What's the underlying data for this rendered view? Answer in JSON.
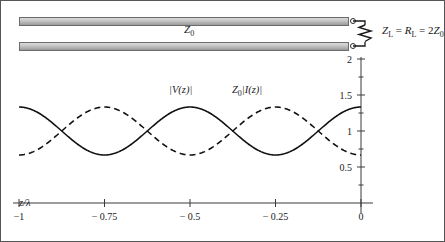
{
  "figure": {
    "schematic": {
      "line_impedance_label": "Z",
      "line_impedance_sub": "0",
      "load_label_parts": {
        "zl": "Z",
        "zl_sub": "L",
        "eq1": " = ",
        "rl": "R",
        "rl_sub": "L",
        "eq2": " = 2",
        "z0": "Z",
        "z0_sub": "0"
      },
      "load_label_plain": "ZL = RL = 2Z0",
      "terminal_icon": "open-terminal-dot",
      "resistor_icon": "zigzag-resistor-icon"
    },
    "plot": {
      "x_axis_label": "z/λ",
      "curve_label_voltage": {
        "text": "|V(z)|"
      },
      "curve_label_current": {
        "prefix": "Z",
        "sub": "0",
        "text": "|I(z)|"
      },
      "curve_label_current_plain": "Z0|I(z)|"
    }
  },
  "chart_data": {
    "type": "line",
    "title": "",
    "xlabel": "z/λ",
    "ylabel": "",
    "xlim": [
      -1,
      0
    ],
    "ylim": [
      0,
      2
    ],
    "xticks": [
      -1,
      -0.75,
      -0.5,
      -0.25,
      0
    ],
    "xticklabels": [
      "−1",
      "− 0.75",
      "− 0.5",
      "− 0.25",
      "0"
    ],
    "yticks": [
      0.5,
      1,
      1.5,
      2
    ],
    "yticklabels": [
      "0.5",
      "1",
      "1.5",
      "2"
    ],
    "y_minor_ticks": [
      0.25,
      0.75,
      1.25,
      1.75
    ],
    "grid": false,
    "legend": "inline-annotations",
    "annotations": [
      {
        "text": "|V(z)|",
        "x": -0.62,
        "y": 1.63
      },
      {
        "text": "Z0|I(z)|",
        "x": -0.38,
        "y": 1.63
      }
    ],
    "series": [
      {
        "name": "|V(z)|",
        "style": "solid",
        "color": "#111111",
        "description": "Voltage standing wave magnitude, maximum at load (z=0), SWR = 2",
        "max": 1.333,
        "min": 0.667,
        "period_in_lambda": 0.5,
        "x": [
          -1.0,
          -0.95,
          -0.9,
          -0.85,
          -0.8,
          -0.75,
          -0.7,
          -0.65,
          -0.6,
          -0.55,
          -0.5,
          -0.45,
          -0.4,
          -0.35,
          -0.3,
          -0.25,
          -0.2,
          -0.15,
          -0.1,
          -0.05,
          0.0
        ],
        "y": [
          1.333,
          1.302,
          1.215,
          1.09,
          0.945,
          0.805,
          0.72,
          0.672,
          0.667,
          0.72,
          0.805,
          0.945,
          1.09,
          1.215,
          1.302,
          1.333,
          1.302,
          1.215,
          1.09,
          0.945,
          1.333
        ]
      },
      {
        "name": "Z0|I(z)|",
        "style": "dashed",
        "color": "#111111",
        "description": "Current standing wave magnitude, minimum at load (z=0), anti-phase with voltage",
        "max": 1.333,
        "min": 0.667,
        "period_in_lambda": 0.5,
        "x": [
          -1.0,
          -0.95,
          -0.9,
          -0.85,
          -0.8,
          -0.75,
          -0.7,
          -0.65,
          -0.6,
          -0.55,
          -0.5,
          -0.45,
          -0.4,
          -0.35,
          -0.3,
          -0.25,
          -0.2,
          -0.15,
          -0.1,
          -0.05,
          0.0
        ],
        "y": [
          0.667,
          0.698,
          0.785,
          0.91,
          1.055,
          1.333,
          1.28,
          1.128,
          1.333,
          1.28,
          1.195,
          1.055,
          0.91,
          0.785,
          0.698,
          0.667,
          0.698,
          0.785,
          0.91,
          1.055,
          0.667
        ]
      }
    ]
  }
}
